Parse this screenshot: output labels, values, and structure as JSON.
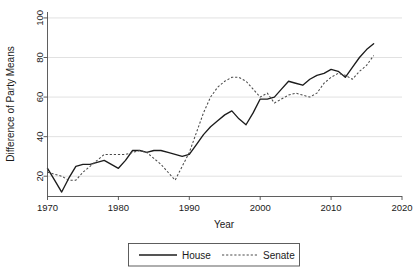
{
  "chart_data": {
    "type": "line",
    "title": "",
    "xlabel": "Year",
    "ylabel": "Difference of Party Means",
    "xlim": [
      1970,
      2020
    ],
    "ylim": [
      10,
      103
    ],
    "xticks": [
      1970,
      1980,
      1990,
      2000,
      2010,
      2020
    ],
    "yticks": [
      20,
      40,
      60,
      80,
      100
    ],
    "grid": true,
    "legend_position": "bottom-center",
    "x": [
      1970,
      1971,
      1972,
      1973,
      1974,
      1975,
      1976,
      1977,
      1978,
      1979,
      1980,
      1981,
      1982,
      1983,
      1984,
      1985,
      1986,
      1987,
      1988,
      1989,
      1990,
      1991,
      1992,
      1993,
      1994,
      1995,
      1996,
      1997,
      1998,
      1999,
      2000,
      2001,
      2002,
      2003,
      2004,
      2005,
      2006,
      2007,
      2008,
      2009,
      2010,
      2011,
      2012,
      2013,
      2014,
      2015,
      2016
    ],
    "series": [
      {
        "name": "House",
        "style": "solid",
        "color": "#1c1c1c",
        "values": [
          24,
          18,
          12,
          19,
          25,
          26,
          26,
          27,
          28,
          26,
          24,
          28,
          33,
          33,
          32,
          33,
          33,
          32,
          31,
          30,
          31,
          36,
          41,
          45,
          48,
          51,
          53,
          49,
          46,
          52,
          59,
          59,
          60,
          64,
          68,
          67,
          66,
          69,
          71,
          72,
          74,
          73,
          70,
          75,
          80,
          84,
          87
        ]
      },
      {
        "name": "Senate",
        "style": "dotted",
        "color": "#4a4a4a",
        "values": [
          22,
          21,
          20,
          18,
          18,
          22,
          25,
          28,
          31,
          31,
          31,
          31,
          32,
          33,
          32,
          29,
          26,
          22,
          18,
          25,
          32,
          42,
          52,
          60,
          65,
          68,
          70,
          70,
          68,
          64,
          60,
          62,
          57,
          59,
          61,
          62,
          61,
          60,
          62,
          67,
          70,
          72,
          71,
          69,
          73,
          76,
          81
        ]
      }
    ]
  },
  "axes": {
    "ytick_labels": [
      "20",
      "40",
      "60",
      "80",
      "100"
    ],
    "xtick_labels": [
      "1970",
      "1980",
      "1990",
      "2000",
      "2010",
      "2020"
    ],
    "ylabel": "Difference of Party Means",
    "xlabel": "Year"
  },
  "legend": {
    "items": [
      {
        "label": "House",
        "style": "solid"
      },
      {
        "label": "Senate",
        "style": "dotted"
      }
    ]
  },
  "caption": {
    "text": ""
  }
}
